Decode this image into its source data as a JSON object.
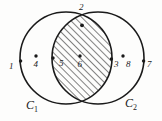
{
  "figure": {
    "background_color": "#fdfdfc",
    "ink_color": "#1a1a1a"
  },
  "sets": {
    "left": {
      "label_text": "C",
      "label_sub": "1",
      "name": "C1"
    },
    "right": {
      "label_text": "C",
      "label_sub": "2",
      "name": "C2"
    }
  },
  "points": {
    "p1": {
      "label": "1",
      "description": "point on left circle boundary, left side"
    },
    "p2": {
      "label": "2",
      "description": "upper intersection point of the two circles"
    },
    "p3": {
      "label": "3",
      "description": "point on left circle boundary, right side of lens"
    },
    "p4": {
      "label": "4",
      "description": "point inside left circle only"
    },
    "p5": {
      "label": "5",
      "description": "point on right circle boundary, left side of lens"
    },
    "p6": {
      "label": "6",
      "description": "point inside the hatched intersection"
    },
    "p7": {
      "label": "7",
      "description": "point on right circle boundary, right side"
    },
    "p8": {
      "label": "8",
      "description": "point inside right circle only"
    }
  },
  "region": {
    "intersection_fill": "hatched",
    "hatch_angle_degrees": 45,
    "hatch_color": "#1a1a1a"
  }
}
